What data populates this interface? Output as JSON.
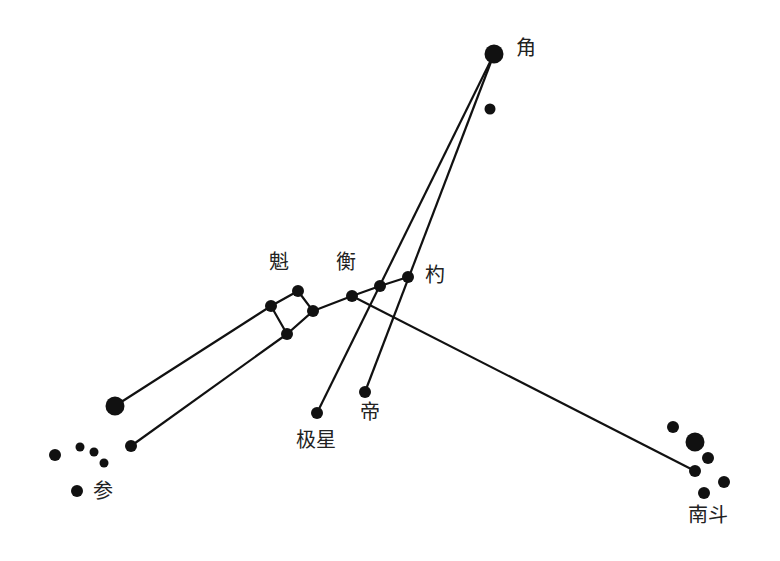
{
  "diagram": {
    "type": "star-map",
    "labels": {
      "jiao": "角",
      "kui": "魁",
      "heng": "衡",
      "shao": "杓",
      "jixing": "极星",
      "di": "帝",
      "shen": "参",
      "nandou": "南斗"
    },
    "colors": {
      "ink": "#111111",
      "background": "#ffffff"
    }
  }
}
